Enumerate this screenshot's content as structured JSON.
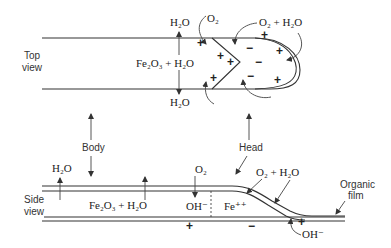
{
  "figure": {
    "top_view": {
      "label_line1": "Top",
      "label_line2": "view",
      "h2o_top": "H₂O",
      "h2o_bottom": "H₂O",
      "center_reaction": "Fe₂O₃ + H₂O",
      "o2_label": "O₂",
      "o2_h2o_label": "O₂ + H₂O",
      "plus": "+",
      "minus": "−"
    },
    "side_view": {
      "label_line1": "Side",
      "label_line2": "view",
      "h2o_label": "H₂O",
      "reaction": "Fe₂O₃ + H₂O",
      "o2_label": "O₂",
      "oh_label": "OH⁻",
      "fe_label": "Fe⁺⁺",
      "o2_h2o_label": "O₂ + H₂O",
      "oh_bottom_label": "OH⁻",
      "organic_film_line1": "Organic",
      "organic_film_line2": "film",
      "plus": "+",
      "minus": "−"
    },
    "callouts": {
      "body": "Body",
      "head": "Head"
    }
  }
}
